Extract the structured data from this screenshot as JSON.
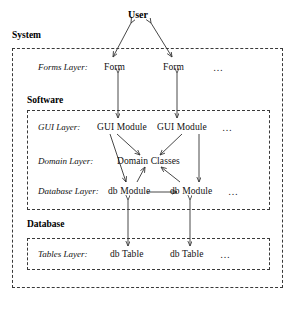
{
  "diagram": {
    "type": "layered-architecture",
    "title_node": "User",
    "containers": [
      {
        "id": "system",
        "label": "System",
        "x": 12,
        "y": 48,
        "w": 271,
        "h": 240
      },
      {
        "id": "forms",
        "label": "",
        "x": 0,
        "y": 0,
        "w": 0,
        "h": 0
      },
      {
        "id": "software",
        "label": "Software",
        "x": 27,
        "y": 110,
        "w": 243,
        "h": 100
      },
      {
        "id": "database",
        "label": "Database",
        "x": 27,
        "y": 238,
        "w": 243,
        "h": 32
      }
    ],
    "layers": [
      {
        "id": "forms-layer",
        "label": "Forms Layer:",
        "nodes": [
          "Form",
          "Form"
        ],
        "ellipsis": "…"
      },
      {
        "id": "gui-layer",
        "label": "GUI Layer:",
        "nodes": [
          "GUI Module",
          "GUI Module"
        ],
        "ellipsis": "…"
      },
      {
        "id": "domain-layer",
        "label": "Domain Layer:",
        "nodes": [
          "Domain Classes"
        ],
        "ellipsis": ""
      },
      {
        "id": "database-layer",
        "label": "Database Layer:",
        "nodes": [
          "db Module",
          "db Module"
        ],
        "ellipsis": "…"
      },
      {
        "id": "tables-layer",
        "label": "Tables Layer:",
        "nodes": [
          "db Table",
          "db Table"
        ],
        "ellipsis": "…"
      }
    ],
    "labels": {
      "user": "User",
      "system": "System",
      "software": "Software",
      "database": "Database",
      "forms_layer": "Forms Layer:",
      "gui_layer": "GUI Layer:",
      "domain_layer": "Domain Layer:",
      "database_layer": "Database Layer:",
      "tables_layer": "Tables Layer:",
      "form_1": "Form",
      "form_2": "Form",
      "gui_module_1": "GUI Module",
      "gui_module_2": "GUI Module",
      "domain_classes": "Domain Classes",
      "db_module_1": "db Module",
      "db_module_2": "db Module",
      "db_table_1": "db Table",
      "db_table_2": "db Table",
      "ellipsis_forms": "…",
      "ellipsis_gui": "…",
      "ellipsis_db_modules": "…",
      "ellipsis_db_tables": "…"
    },
    "colors": {
      "ink": "#111111",
      "border": "#3a3a3a",
      "arrow": "#333333",
      "background": "#ffffff"
    }
  }
}
